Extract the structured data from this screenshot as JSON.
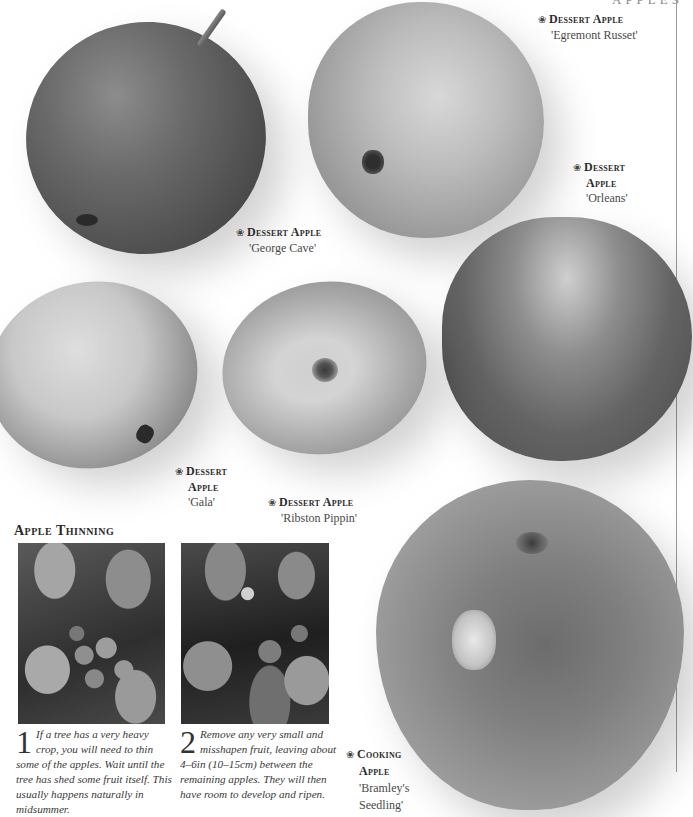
{
  "page": {
    "running_head": "APPLES"
  },
  "apples": [
    {
      "id": "george-cave",
      "type_label": "Dessert Apple",
      "type_line1": "Dessert Apple",
      "type_line2": "",
      "variety": "'George Cave'"
    },
    {
      "id": "egremont-russet",
      "type_label": "Dessert Apple",
      "type_line1": "Dessert Apple",
      "type_line2": "",
      "variety": "'Egremont Russet'"
    },
    {
      "id": "orleans",
      "type_label": "Dessert Apple",
      "type_line1": "Dessert",
      "type_line2": "Apple",
      "variety": "'Orleans'"
    },
    {
      "id": "gala",
      "type_label": "Dessert Apple",
      "type_line1": "Dessert",
      "type_line2": "Apple",
      "variety": "'Gala'"
    },
    {
      "id": "ribston-pippin",
      "type_label": "Dessert Apple",
      "type_line1": "Dessert Apple",
      "type_line2": "",
      "variety": "'Ribston Pippin'"
    },
    {
      "id": "bramleys-seedling",
      "type_label": "Cooking Apple",
      "type_line1": "Cooking",
      "type_line2": "Apple",
      "variety_line1": "'Bramley's",
      "variety_line2": "Seedling'"
    }
  ],
  "caption_icon": "❀",
  "thinning": {
    "title": "Apple Thinning",
    "steps": [
      {
        "number": "1",
        "text": "If a tree has a very heavy crop, you will need to thin some of the apples. Wait until the tree has shed some fruit itself. This usually happens naturally in midsummer."
      },
      {
        "number": "2",
        "text": "Remove any very small and misshapen fruit, leaving about 4–6in (10–15cm) between the remaining apples. They will then have room to develop and ripen."
      }
    ]
  }
}
